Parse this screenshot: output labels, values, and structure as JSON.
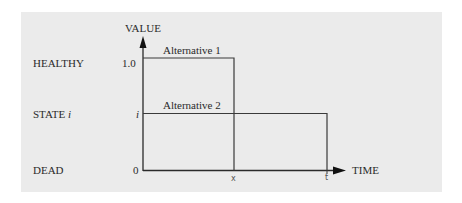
{
  "diagram": {
    "y_axis_label": "VALUE",
    "x_axis_label": "TIME",
    "states": [
      {
        "label": "HEALTHY",
        "value_label": "1.0"
      },
      {
        "label_prefix": "STATE ",
        "label_var": "i",
        "value_label": "i"
      },
      {
        "label": "DEAD",
        "value_label": "0"
      }
    ],
    "x_ticks": [
      "x",
      "t"
    ],
    "alternatives": [
      {
        "name": "Alternative 1",
        "value": "1.0",
        "duration": "x"
      },
      {
        "name": "Alternative 2",
        "value": "i",
        "duration": "t"
      }
    ],
    "colors": {
      "panel_background": "#ebebeb",
      "line": "#3a3a3a",
      "text": "#2a2a2a"
    }
  }
}
